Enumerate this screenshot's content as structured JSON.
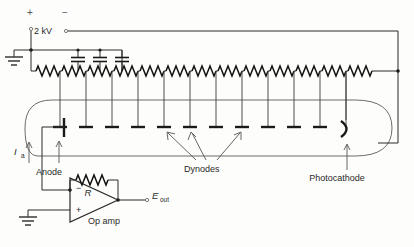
{
  "diagram": {
    "source": {
      "voltage_label": "2 kV",
      "plus_sign": "+",
      "minus_sign": "−"
    },
    "labels": {
      "anode": "Anode",
      "dynodes": "Dynodes",
      "photocathode": "Photocathode",
      "op_amp": "Op amp",
      "feedback_resistor": "R",
      "anode_current": "I",
      "anode_current_sub": "a",
      "output": "E",
      "output_sub": "out",
      "opamp_inverting": "−",
      "opamp_noninverting": "+"
    },
    "counts": {
      "capacitors": 3,
      "dynodes": 11,
      "divider_resistors": 13,
      "dynode_arrows": 3,
      "grounds": 2
    },
    "colors": {
      "wire": "#2b2b2b",
      "envelope": "#6b6b6b",
      "electrode": "#1a1a1a",
      "background": "#fdfdfb",
      "label_text": "#2a2a2a"
    }
  }
}
